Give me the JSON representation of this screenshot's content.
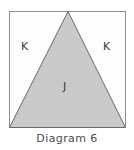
{
  "figure": {
    "caption": "Diagram 6",
    "background_color": "#ffffff",
    "square": {
      "name": "outer-square",
      "x": 9,
      "y": 11,
      "width": 117,
      "height": 117,
      "fill_color": "#fdfdfd",
      "stroke_color": "#8d8d8d",
      "stroke_width": 1
    },
    "triangle": {
      "name": "inscribed-triangle",
      "apex_x": 68,
      "apex_y": 11,
      "base_left_x": 9,
      "base_left_y": 128,
      "base_right_x": 126,
      "base_right_y": 128,
      "fill_color": "#c9c9c9",
      "stroke_color": "#6b6b6b",
      "stroke_width": 1
    },
    "labels": {
      "k_left": "K",
      "k_right": "K",
      "j_center": "J",
      "text_color": "#3a3a3a"
    }
  }
}
